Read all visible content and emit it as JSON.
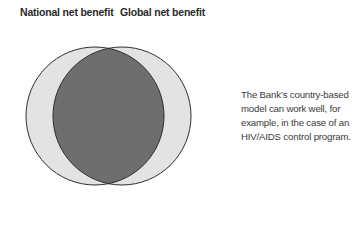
{
  "labels": {
    "left": "National net benefit",
    "right": "Global net benefit"
  },
  "annotation": "The Bank’s country-based model can work well, for example, in the case of an HIV/AIDS control program.",
  "diagram": {
    "type": "venn",
    "sets": [
      "National net benefit",
      "Global net benefit"
    ],
    "overlap": "large",
    "colors": {
      "outer": "#e3e3e3",
      "overlap": "#6e6e6e",
      "stroke": "#2e2e2e"
    }
  }
}
